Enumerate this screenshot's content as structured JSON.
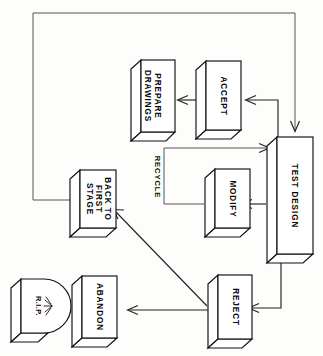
{
  "diagram": {
    "orientation": "rotated-90-clockwise",
    "background_color": "#fdfdfb",
    "line_color": "#222222",
    "box_fill": "#ffffff",
    "nodes": [
      {
        "id": "test-design",
        "label": "TEST DESIGN",
        "shape": "3d-box"
      },
      {
        "id": "accept",
        "label": "ACCEPT",
        "shape": "3d-box"
      },
      {
        "id": "prepare-drawings",
        "label_line1": "PREPARE",
        "label_line2": "DRAWINGS",
        "shape": "3d-box"
      },
      {
        "id": "modify",
        "label": "MODIFY",
        "shape": "3d-box"
      },
      {
        "id": "back-to-first-stage",
        "label_line1": "BACK TO",
        "label_line2": "FIRST",
        "label_line3": "STAGE",
        "shape": "3d-box"
      },
      {
        "id": "reject",
        "label": "REJECT",
        "shape": "3d-box"
      },
      {
        "id": "abandon",
        "label": "ABANDON",
        "shape": "3d-box"
      },
      {
        "id": "rip-tombstone",
        "label": "R.I.P.",
        "shape": "3d-tombstone"
      }
    ],
    "edge_labels": [
      {
        "id": "recycle",
        "label": "RECYCLE"
      }
    ]
  }
}
